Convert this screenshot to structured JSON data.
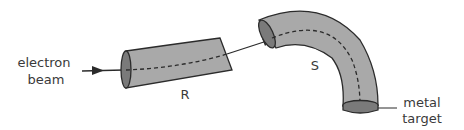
{
  "diagram": {
    "labels": {
      "electron_beam_line1": "electron",
      "electron_beam_line2": "beam",
      "tube_r": "R",
      "tube_s": "S",
      "metal_target_line1": "metal",
      "metal_target_line2": "target"
    },
    "colors": {
      "tube_fill": "#a9a9a9",
      "tube_end_fill": "#7a7a7a",
      "outline": "#2b2b2b",
      "text": "#3a3a3a"
    }
  }
}
